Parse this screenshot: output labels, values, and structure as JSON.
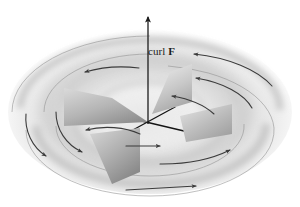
{
  "figure": {
    "name": "curl-paddle-wheel-diagram",
    "background_color": "#ffffff",
    "ink_color": "#333333",
    "axis_color": "#111111",
    "label": {
      "text_prefix": "curl ",
      "vector_symbol": "F",
      "full_text": "curl F"
    },
    "curl_vector": {
      "name": "curl-vector-arrow",
      "direction": "up",
      "x": 148,
      "y_tip": 15,
      "y_base": 124
    },
    "origin": {
      "x": 148,
      "y": 122
    },
    "axes": [
      {
        "name": "axis-line-x",
        "x1": 113,
        "y1": 114,
        "x2": 183,
        "y2": 131
      },
      {
        "name": "axis-line-y",
        "x1": 120,
        "y1": 136,
        "x2": 174,
        "y2": 108
      }
    ],
    "paddles": [
      {
        "name": "paddle-blade-left",
        "fill_light": "#d7d7d7",
        "fill_dark": "#9a9a9a"
      },
      {
        "name": "paddle-blade-right",
        "fill_light": "#d9d9d9",
        "fill_dark": "#a2a2a2"
      },
      {
        "name": "paddle-blade-back",
        "fill_light": "#e0e0e0",
        "fill_dark": "#a8a8a8"
      },
      {
        "name": "paddle-blade-front",
        "fill_light": "#cfcfcf",
        "fill_dark": "#969696"
      }
    ],
    "flow_arrows": [
      {
        "name": "flow-arrow-outer-top-right",
        "direction": "counterclockwise"
      },
      {
        "name": "flow-arrow-outer-top-left",
        "direction": "counterclockwise"
      },
      {
        "name": "flow-arrow-outer-left",
        "direction": "counterclockwise"
      },
      {
        "name": "flow-arrow-inner-left",
        "direction": "counterclockwise"
      },
      {
        "name": "flow-arrow-outer-bottom",
        "direction": "counterclockwise"
      },
      {
        "name": "flow-arrow-inner-bottom",
        "direction": "counterclockwise"
      },
      {
        "name": "flow-arrow-inner-top-right",
        "direction": "counterclockwise"
      },
      {
        "name": "flow-arrow-hub-right",
        "direction": "counterclockwise"
      },
      {
        "name": "flow-arrow-inner-upper-left",
        "direction": "counterclockwise"
      },
      {
        "name": "flow-arrow-label-right",
        "direction": "counterclockwise"
      }
    ],
    "swirl": {
      "name": "background-swirl",
      "type": "concentric-elliptical-shading",
      "center_x": 150,
      "center_y": 115,
      "shade_light": "#ffffff",
      "shade_mid": "#e6e6e6",
      "shade_dark": "#c4c4c4"
    }
  }
}
